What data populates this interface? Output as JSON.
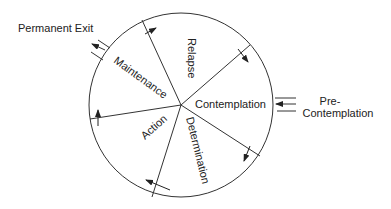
{
  "diagram": {
    "title": "",
    "segments": [
      {
        "label": "Relapse"
      },
      {
        "label": "Contemplation"
      },
      {
        "label": "Determination"
      },
      {
        "label": "Action"
      },
      {
        "label": "Maintenance"
      }
    ],
    "external": {
      "entry": {
        "label_line1": "Pre-",
        "label_line2": "Contemplation"
      },
      "exit": {
        "label": "Permanent Exit"
      }
    },
    "colors": {
      "stroke": "#333333",
      "text": "#222222",
      "background": "#ffffff"
    }
  }
}
